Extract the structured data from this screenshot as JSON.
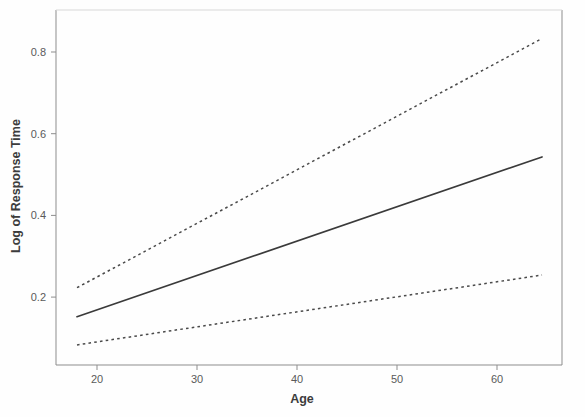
{
  "chart_data": {
    "type": "line",
    "title": "",
    "xlabel": "Age",
    "ylabel": "Log of Response Time",
    "xlim": [
      15.5,
      67.5
    ],
    "ylim": [
      0.04,
      0.875
    ],
    "grid": false,
    "legend": "none",
    "xticks": [
      20,
      30,
      40,
      50,
      60
    ],
    "xticklabels": [
      "20",
      "30",
      "40",
      "50",
      "60"
    ],
    "yticks": [
      0.2,
      0.4,
      0.6,
      0.8
    ],
    "yticklabels": [
      "0.2",
      "0.4",
      "0.6",
      "0.8"
    ],
    "x": [
      18,
      64.5
    ],
    "series": [
      {
        "name": "Upper confidence band",
        "style": "dashed",
        "values": [
          0.223,
          0.833
        ]
      },
      {
        "name": "Fitted regression line",
        "style": "solid",
        "values": [
          0.152,
          0.543
        ]
      },
      {
        "name": "Lower confidence band",
        "style": "dashed",
        "values": [
          0.083,
          0.254
        ]
      }
    ],
    "annotations": []
  },
  "axes": {
    "x_title": "Age",
    "y_title": "Log of Response Time"
  },
  "colors": {
    "background": "#fefefe",
    "frame": "#8d8d8d",
    "fit_line": "#3a3a3a",
    "band_line": "#4a4a4a",
    "text": "#5a5a5a"
  }
}
